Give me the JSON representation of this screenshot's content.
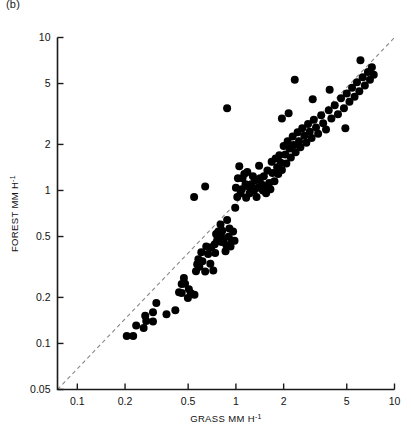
{
  "figure": {
    "panel_label": "(b)",
    "background_color": "#ffffff",
    "marker_color": "#000000",
    "axis_color": "#1a1a1a",
    "reference_line_color": "#8a8a8a"
  },
  "chart_data": {
    "type": "scatter",
    "title": "",
    "subtitle": "",
    "xlabel": "GRASS MM H",
    "xlabel_exponent": "-1",
    "ylabel": "FOREST MM H",
    "ylabel_exponent": "-1",
    "xscale": "log",
    "yscale": "log",
    "xlim": [
      0.075,
      10
    ],
    "ylim": [
      0.05,
      10
    ],
    "xticks": [
      0.1,
      0.2,
      0.5,
      1,
      2,
      5,
      10
    ],
    "xticklabels": [
      "0.1",
      "0.2",
      "0.5",
      "1",
      "2",
      "5",
      "10"
    ],
    "yticks": [
      0.05,
      0.1,
      0.2,
      0.5,
      1,
      2,
      5,
      10
    ],
    "yticklabels": [
      "0.05",
      "0.1",
      "0.2",
      "0.5",
      "1",
      "2",
      "5",
      "10"
    ],
    "grid": false,
    "legend": null,
    "annotations": [
      {
        "text": "1:1 reference line",
        "style": "dashed",
        "from": [
          0.075,
          0.05
        ],
        "to": [
          10,
          10
        ]
      }
    ],
    "series": [
      {
        "name": "Forest vs Grass interception",
        "marker": "filled-circle",
        "marker_size_px": 8,
        "color": "#000000",
        "points": [
          [
            0.205,
            0.112
          ],
          [
            0.225,
            0.112
          ],
          [
            0.235,
            0.131
          ],
          [
            0.262,
            0.126
          ],
          [
            0.268,
            0.152
          ],
          [
            0.272,
            0.14
          ],
          [
            0.3,
            0.16
          ],
          [
            0.3,
            0.139
          ],
          [
            0.315,
            0.184
          ],
          [
            0.365,
            0.155
          ],
          [
            0.415,
            0.165
          ],
          [
            0.438,
            0.216
          ],
          [
            0.455,
            0.214
          ],
          [
            0.455,
            0.245
          ],
          [
            0.47,
            0.268
          ],
          [
            0.478,
            0.246
          ],
          [
            0.498,
            0.198
          ],
          [
            0.505,
            0.226
          ],
          [
            0.52,
            0.213
          ],
          [
            0.548,
            0.208
          ],
          [
            0.56,
            0.297
          ],
          [
            0.57,
            0.33
          ],
          [
            0.58,
            0.355
          ],
          [
            0.588,
            0.317
          ],
          [
            0.605,
            0.395
          ],
          [
            0.615,
            0.345
          ],
          [
            0.64,
            0.295
          ],
          [
            0.65,
            0.43
          ],
          [
            0.668,
            0.385
          ],
          [
            0.69,
            0.332
          ],
          [
            0.7,
            0.425
          ],
          [
            0.72,
            0.3
          ],
          [
            0.735,
            0.445
          ],
          [
            0.74,
            0.39
          ],
          [
            0.75,
            0.52
          ],
          [
            0.76,
            0.47
          ],
          [
            0.768,
            0.495
          ],
          [
            0.775,
            0.54
          ],
          [
            0.79,
            0.47
          ],
          [
            0.8,
            0.6
          ],
          [
            0.805,
            0.512
          ],
          [
            0.812,
            0.46
          ],
          [
            0.82,
            0.545
          ],
          [
            0.835,
            0.478
          ],
          [
            0.86,
            0.4
          ],
          [
            0.87,
            0.44
          ],
          [
            0.88,
            0.64
          ],
          [
            0.9,
            0.498
          ],
          [
            0.91,
            0.565
          ],
          [
            0.925,
            0.43
          ],
          [
            0.945,
            0.47
          ],
          [
            0.96,
            0.54
          ],
          [
            0.98,
            0.47
          ],
          [
            0.545,
            0.905
          ],
          [
            0.64,
            1.06
          ],
          [
            0.88,
            3.45
          ],
          [
            0.99,
            0.77
          ],
          [
            1.0,
            1.04
          ],
          [
            1.02,
            0.905
          ],
          [
            1.03,
            1.2
          ],
          [
            1.05,
            1.44
          ],
          [
            1.07,
            0.96
          ],
          [
            1.09,
            1.02
          ],
          [
            1.1,
            1.2
          ],
          [
            1.13,
            1.28
          ],
          [
            1.15,
            1.1
          ],
          [
            1.16,
            0.895
          ],
          [
            1.18,
            1.32
          ],
          [
            1.2,
            1.06
          ],
          [
            1.22,
            0.96
          ],
          [
            1.25,
            1.1
          ],
          [
            1.28,
            1.24
          ],
          [
            1.3,
            1.0
          ],
          [
            1.32,
            1.16
          ],
          [
            1.35,
            0.905
          ],
          [
            1.38,
            1.04
          ],
          [
            1.4,
            1.45
          ],
          [
            1.42,
            1.2
          ],
          [
            1.45,
            1.1
          ],
          [
            1.48,
            1.0
          ],
          [
            1.5,
            1.24
          ],
          [
            1.52,
            1.06
          ],
          [
            1.55,
            0.96
          ],
          [
            1.58,
            1.35
          ],
          [
            1.62,
            1.12
          ],
          [
            1.65,
            1.02
          ],
          [
            1.68,
            1.54
          ],
          [
            1.7,
            1.3
          ],
          [
            1.75,
            1.15
          ],
          [
            1.78,
            1.62
          ],
          [
            1.82,
            1.42
          ],
          [
            1.85,
            1.28
          ],
          [
            1.88,
            1.7
          ],
          [
            1.92,
            1.52
          ],
          [
            1.95,
            1.36
          ],
          [
            2.0,
            1.95
          ],
          [
            2.05,
            1.72
          ],
          [
            2.08,
            1.5
          ],
          [
            2.12,
            2.1
          ],
          [
            2.18,
            1.88
          ],
          [
            2.22,
            1.64
          ],
          [
            2.28,
            2.25
          ],
          [
            2.32,
            1.98
          ],
          [
            2.38,
            1.78
          ],
          [
            2.45,
            2.4
          ],
          [
            2.5,
            2.1
          ],
          [
            2.55,
            1.92
          ],
          [
            2.62,
            2.55
          ],
          [
            2.7,
            2.28
          ],
          [
            2.78,
            2.05
          ],
          [
            2.85,
            2.72
          ],
          [
            2.92,
            2.42
          ],
          [
            3.0,
            2.2
          ],
          [
            3.1,
            2.9
          ],
          [
            3.2,
            2.58
          ],
          [
            3.3,
            2.35
          ],
          [
            3.45,
            3.1
          ],
          [
            3.55,
            2.75
          ],
          [
            3.7,
            2.5
          ],
          [
            3.85,
            3.35
          ],
          [
            4.0,
            2.95
          ],
          [
            4.2,
            3.6
          ],
          [
            4.4,
            3.15
          ],
          [
            4.6,
            4.0
          ],
          [
            4.8,
            3.45
          ],
          [
            5.0,
            4.3
          ],
          [
            5.2,
            3.8
          ],
          [
            5.4,
            4.7
          ],
          [
            5.6,
            4.1
          ],
          [
            5.8,
            5.1
          ],
          [
            6.0,
            4.45
          ],
          [
            6.3,
            5.5
          ],
          [
            6.5,
            4.85
          ],
          [
            6.8,
            5.95
          ],
          [
            7.0,
            5.3
          ],
          [
            7.2,
            6.4
          ],
          [
            7.4,
            5.7
          ],
          [
            6.1,
            7.1
          ],
          [
            2.35,
            5.3
          ],
          [
            4.9,
            2.55
          ],
          [
            1.95,
            2.95
          ],
          [
            2.15,
            3.2
          ],
          [
            3.05,
            3.95
          ],
          [
            3.9,
            4.55
          ]
        ]
      }
    ]
  }
}
